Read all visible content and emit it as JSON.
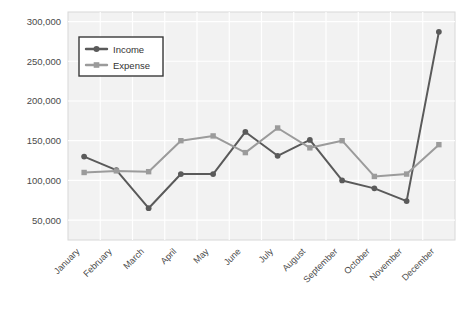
{
  "chart_data": {
    "type": "line",
    "title": "",
    "subtitle": "",
    "xlabel": "",
    "ylabel": "",
    "categories": [
      "January",
      "February",
      "March",
      "April",
      "May",
      "June",
      "July",
      "August",
      "September",
      "October",
      "November",
      "December"
    ],
    "series": [
      {
        "name": "Income",
        "color": "#5a5a5a",
        "marker": "circle",
        "values": [
          130000,
          113000,
          65000,
          108000,
          108000,
          161000,
          131000,
          151000,
          100000,
          90000,
          74000,
          287000
        ]
      },
      {
        "name": "Expense",
        "color": "#9b9b9b",
        "marker": "square",
        "values": [
          110000,
          112000,
          111000,
          150000,
          156000,
          135000,
          166000,
          141000,
          150000,
          105000,
          108000,
          145000
        ]
      }
    ],
    "ylim": [
      25000,
      312000
    ],
    "yticks": [
      50000,
      100000,
      150000,
      200000,
      250000,
      300000
    ],
    "ytick_labels": [
      "50,000",
      "100,000",
      "150,000",
      "200,000",
      "250,000",
      "300,000"
    ],
    "grid": true,
    "grid_color": "#ffffff",
    "plot_background": "#f2f2f2",
    "legend_position": "top-left",
    "xtick_rotation": -45
  },
  "legend": {
    "entries": [
      {
        "label": "Income"
      },
      {
        "label": "Expense"
      }
    ]
  },
  "axes": {
    "y_tick_labels": [
      "300,000",
      "250,000",
      "200,000",
      "150,000",
      "100,000",
      "50,000"
    ],
    "x_tick_labels": [
      "January",
      "February",
      "March",
      "April",
      "May",
      "June",
      "July",
      "August",
      "September",
      "October",
      "November",
      "December"
    ]
  }
}
